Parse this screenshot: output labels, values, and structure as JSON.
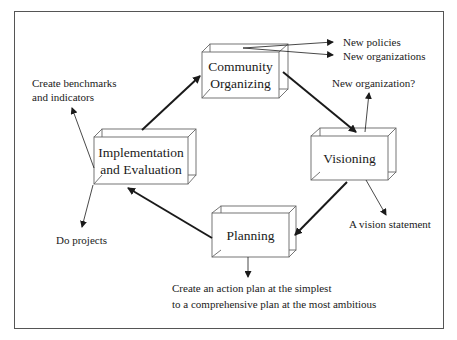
{
  "diagram": {
    "title": "",
    "nodes": [
      {
        "id": "community",
        "label_line1": "Community",
        "label_line2": "Organizing"
      },
      {
        "id": "visioning",
        "label_line1": "Visioning",
        "label_line2": ""
      },
      {
        "id": "planning",
        "label_line1": "Planning",
        "label_line2": ""
      },
      {
        "id": "implementation",
        "label_line1": "Implementation",
        "label_line2": "and Evaluation"
      }
    ],
    "cycle_edges": [
      {
        "from": "implementation",
        "to": "community"
      },
      {
        "from": "community",
        "to": "visioning"
      },
      {
        "from": "visioning",
        "to": "planning"
      },
      {
        "from": "planning",
        "to": "implementation"
      }
    ],
    "outputs": {
      "community_1": "New policies",
      "community_2": "New organizations",
      "visioning_up": "New organization?",
      "visioning_down": "A vision statement",
      "planning_line1": "Create an action plan at the simplest",
      "planning_line2": "to a comprehensive plan at the most ambitious",
      "implementation_up_line1": "Create benchmarks",
      "implementation_up_line2": "and indicators",
      "implementation_down": "Do projects"
    },
    "colors": {
      "line": "#1a1a1a",
      "box_edge": "#666666",
      "frame": "#555555"
    }
  }
}
